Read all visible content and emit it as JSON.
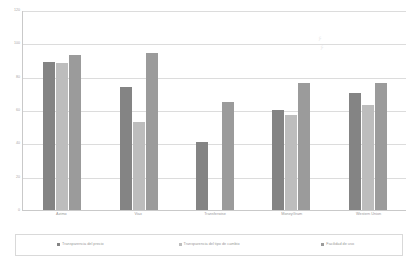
{
  "chart_data": {
    "type": "bar",
    "title": "",
    "subtitle": "",
    "xlabel": "",
    "ylabel": "",
    "ylim": [
      0,
      120
    ],
    "yticks": [
      0,
      20,
      40,
      60,
      80,
      100,
      120
    ],
    "ytick_labels": [
      "0",
      "20",
      "40",
      "60",
      "80",
      "100",
      "120"
    ],
    "grid": true,
    "legend_position": "bottom",
    "categories": [
      "Azimo",
      "Viax",
      "Transferwise",
      "MoneyGram",
      "Western Union"
    ],
    "series": [
      {
        "name": "Transparencia del precio",
        "color": "#848484",
        "values": [
          89,
          74,
          41,
          60,
          70
        ]
      },
      {
        "name": "Transparencia del tipo de cambio",
        "color": "#bdbdbd",
        "values": [
          88,
          53,
          0,
          57,
          63
        ]
      },
      {
        "name": "Facilidad de uso",
        "color": "#9b9b9b",
        "values": [
          93,
          94,
          65,
          76,
          76
        ]
      }
    ]
  },
  "legend": {
    "items": [
      {
        "label": "Transparencia del precio",
        "color": "#848484"
      },
      {
        "label": "Transparencia del tipo de cambio",
        "color": "#bdbdbd"
      },
      {
        "label": "Facilidad de uso",
        "color": "#9b9b9b"
      }
    ]
  }
}
